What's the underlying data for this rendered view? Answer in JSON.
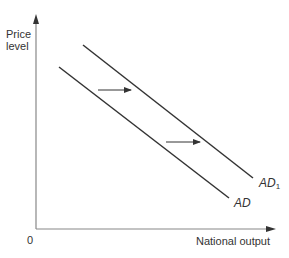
{
  "diagram": {
    "type": "aggregate-demand-shift",
    "y_axis_label_line1": "Price",
    "y_axis_label_line2": "level",
    "x_axis_label": "National output",
    "origin_label": "0",
    "curves": [
      {
        "name": "AD",
        "label": "AD",
        "subscript": ""
      },
      {
        "name": "AD1",
        "label": "AD",
        "subscript": "1"
      }
    ],
    "shift_direction": "right",
    "colors": {
      "line": "#333333",
      "axis": "#888888",
      "text": "#333333"
    }
  }
}
